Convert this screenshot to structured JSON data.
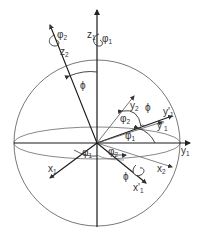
{
  "diagram": {
    "colors": {
      "axis": "#1a1a1a",
      "thin": "#555555",
      "arc": "#444444",
      "label": "#333333",
      "background": "#ffffff"
    },
    "axes": {
      "z1": {
        "base": "z",
        "sub": "1"
      },
      "z2": {
        "base": "z",
        "sub": "2"
      },
      "y1": {
        "base": "y",
        "sub": "1"
      },
      "y2": {
        "base": "y",
        "sub": "2"
      },
      "y1p": {
        "base": "y'",
        "sub": "1"
      },
      "y1p_outer": {
        "base": "y'",
        "sub": "1"
      },
      "x1": {
        "base": "x",
        "sub": "1"
      },
      "x2": {
        "base": "x",
        "sub": "2"
      },
      "x1p": {
        "base": "x'",
        "sub": "1"
      }
    },
    "angles": {
      "phi": "ϕ",
      "phi1": {
        "base": "φ",
        "sub": "1"
      },
      "phi2": {
        "base": "φ",
        "sub": "2"
      }
    },
    "rotation_marks": {
      "about_z1": {
        "base": "φ",
        "sub": "1"
      },
      "about_z2": {
        "base": "φ",
        "sub": "2"
      },
      "about_x1p": "ϕ"
    }
  }
}
